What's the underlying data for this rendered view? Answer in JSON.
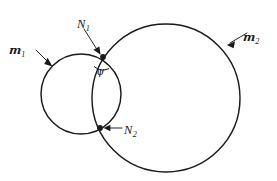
{
  "figure": {
    "background_color": "#ffffff",
    "stroke_color": "#1a1a1a",
    "width": 277,
    "height": 181
  },
  "labels": {
    "m1": {
      "base": "m",
      "sub": "1",
      "role": "small-circle-label"
    },
    "m2": {
      "base": "m",
      "sub": "2",
      "role": "large-circle-label"
    },
    "N1": {
      "base": "N",
      "sub": "1",
      "role": "upper-intersection-label"
    },
    "N2": {
      "base": "N",
      "sub": "2",
      "role": "lower-intersection-label"
    },
    "psi": {
      "text": "ψ",
      "role": "intersection-angle-label"
    }
  },
  "chart_data": {
    "type": "diagram",
    "title": "",
    "elements": [
      {
        "kind": "circle",
        "name": "m1",
        "label": "m₁",
        "cx": 81,
        "cy": 94,
        "r": 40
      },
      {
        "kind": "circle",
        "name": "m2",
        "label": "m₂",
        "cx": 166,
        "cy": 98,
        "r": 74
      },
      {
        "kind": "point",
        "name": "N1",
        "label": "N₁",
        "x": 103,
        "y": 57
      },
      {
        "kind": "point",
        "name": "N2",
        "label": "N₂",
        "x": 100,
        "y": 128
      },
      {
        "kind": "angle",
        "name": "psi",
        "label": "ψ",
        "vertex_x": 103,
        "vertex_y": 57,
        "arc_radius": 13
      }
    ],
    "leaders": [
      {
        "name": "m1-leader",
        "from_x": 36,
        "from_y": 50,
        "to_x": 51,
        "to_y": 65
      },
      {
        "name": "m2-leader",
        "from_x": 247,
        "from_y": 33,
        "to_x": 227,
        "to_y": 45
      },
      {
        "name": "N1-leader",
        "from_x": 84,
        "from_y": 29,
        "to_x": 100,
        "to_y": 54
      },
      {
        "name": "N2-leader",
        "from_x": 122,
        "from_y": 128,
        "to_x": 104,
        "to_y": 128
      }
    ]
  }
}
